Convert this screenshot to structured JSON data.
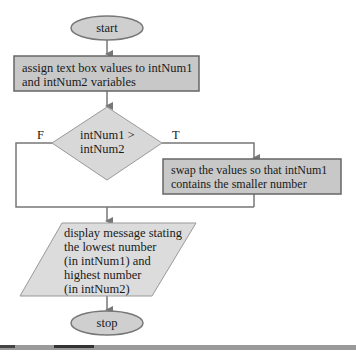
{
  "flowchart": {
    "start": {
      "label": "start"
    },
    "step1": {
      "label_line1": "assign text box values to intNum1",
      "label_line2": "and intNum2 variables"
    },
    "decision": {
      "label_line1": "intNum1 >",
      "label_line2": "intNum2",
      "false_label": "F",
      "true_label": "T"
    },
    "swap": {
      "label_line1": "swap the values so that intNum1",
      "label_line2": "contains the smaller number"
    },
    "output": {
      "lines": [
        "display message stating",
        "the lowest number",
        "(in intNum1) and",
        "highest number",
        "(in intNum2)"
      ]
    },
    "stop": {
      "label": "stop"
    }
  },
  "colors": {
    "shape_fill": "#cfcfcf",
    "shape_fill_light": "#dcdcdc",
    "stroke": "#777777",
    "text": "#1a1a1a"
  }
}
